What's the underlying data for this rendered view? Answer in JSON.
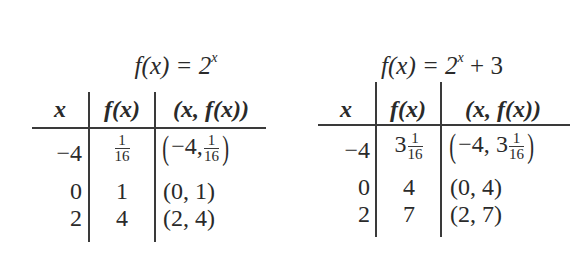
{
  "tables": [
    {
      "title": {
        "prefix": "f(x) = 2",
        "exponent": "x",
        "suffix": ""
      },
      "headers": [
        "x",
        "f(x)",
        "(x, f(x))"
      ],
      "rows": [
        {
          "x": "−4",
          "fx_whole": "",
          "fx_num": "1",
          "fx_den": "16",
          "pair_prefix": "−4,",
          "pair_whole": "",
          "pair_num": "1",
          "pair_den": "16"
        },
        {
          "x": "0",
          "fx": "1",
          "pair": "(0, 1)"
        },
        {
          "x": "2",
          "fx": "4",
          "pair": "(2, 4)"
        }
      ]
    },
    {
      "title": {
        "prefix": "f(x) = 2",
        "exponent": "x",
        "suffix": " + 3"
      },
      "headers": [
        "x",
        "f(x)",
        "(x, f(x))"
      ],
      "rows": [
        {
          "x": "−4",
          "fx_whole": "3",
          "fx_num": "1",
          "fx_den": "16",
          "pair_prefix": "−4,",
          "pair_whole": "3",
          "pair_num": "1",
          "pair_den": "16"
        },
        {
          "x": "0",
          "fx": "4",
          "pair": "(0, 4)"
        },
        {
          "x": "2",
          "fx": "7",
          "pair": "(2, 7)"
        }
      ]
    }
  ]
}
